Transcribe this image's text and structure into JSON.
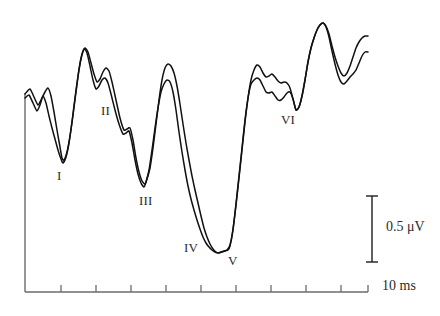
{
  "figure": {
    "kind": "abr-waveform",
    "background_color": "#ffffff",
    "trace_color": "#111111",
    "axis_color": "#6b6b6b",
    "label_color": "#2b2b2b"
  },
  "peak_labels": [
    {
      "text": "I",
      "x": 57,
      "y": 168
    },
    {
      "text": "II",
      "x": 101,
      "y": 103
    },
    {
      "text": "III",
      "x": 139,
      "y": 193
    },
    {
      "text": "IV",
      "x": 184,
      "y": 240
    },
    {
      "text": "V",
      "x": 228,
      "y": 253
    },
    {
      "text": "VI",
      "x": 281,
      "y": 112
    }
  ],
  "scale_bars": {
    "vertical": {
      "label": "0.5 μV",
      "label_x": 386,
      "label_y": 219,
      "x": 372,
      "y_top": 196,
      "y_bottom": 262,
      "cap_half_width": 6
    },
    "horizontal": {
      "label": "10 ms",
      "label_x": 382,
      "label_y": 278
    }
  },
  "axes": {
    "x_axis": {
      "x_start": 25,
      "x_end": 368,
      "y": 292
    },
    "y_axis": {
      "x": 25,
      "y_top": 93,
      "y_bottom": 292
    },
    "tick_count": 9,
    "tick_length": 7,
    "tick_x_positions": [
      61,
      96,
      131,
      166,
      201,
      236,
      271,
      306,
      341
    ]
  },
  "chart_data": {
    "type": "line",
    "title": "",
    "xlabel": "",
    "ylabel": "",
    "xlim": [
      0,
      10
    ],
    "ylim": [
      -1.0,
      1.0
    ],
    "grid": false,
    "legend": "none",
    "x_unit": "ms",
    "y_unit": "μV",
    "annotations": [
      "I",
      "II",
      "III",
      "IV",
      "V",
      "VI"
    ],
    "series": [
      {
        "name": "trace-a",
        "points": [
          [
            25,
            94
          ],
          [
            30,
            89
          ],
          [
            34,
            97
          ],
          [
            38,
            105
          ],
          [
            41,
            100
          ],
          [
            45,
            92
          ],
          [
            48,
            88
          ],
          [
            51,
            96
          ],
          [
            54,
            112
          ],
          [
            57,
            130
          ],
          [
            60,
            147
          ],
          [
            62,
            158
          ],
          [
            64,
            160
          ],
          [
            67,
            152
          ],
          [
            70,
            136
          ],
          [
            73,
            115
          ],
          [
            76,
            92
          ],
          [
            79,
            70
          ],
          [
            82,
            55
          ],
          [
            85,
            48
          ],
          [
            88,
            52
          ],
          [
            91,
            63
          ],
          [
            94,
            74
          ],
          [
            97,
            82
          ],
          [
            100,
            79
          ],
          [
            103,
            72
          ],
          [
            106,
            68
          ],
          [
            109,
            71
          ],
          [
            112,
            82
          ],
          [
            116,
            100
          ],
          [
            120,
            118
          ],
          [
            124,
            130
          ],
          [
            127,
            129
          ],
          [
            130,
            128
          ],
          [
            133,
            140
          ],
          [
            136,
            158
          ],
          [
            139,
            172
          ],
          [
            142,
            181
          ],
          [
            145,
            184
          ],
          [
            147,
            179
          ],
          [
            150,
            168
          ],
          [
            153,
            148
          ],
          [
            156,
            124
          ],
          [
            159,
            100
          ],
          [
            162,
            80
          ],
          [
            165,
            68
          ],
          [
            168,
            64
          ],
          [
            171,
            66
          ],
          [
            174,
            73
          ],
          [
            177,
            86
          ],
          [
            180,
            104
          ],
          [
            183,
            124
          ],
          [
            186,
            143
          ],
          [
            189,
            160
          ],
          [
            192,
            176
          ],
          [
            195,
            190
          ],
          [
            198,
            203
          ],
          [
            201,
            216
          ],
          [
            204,
            228
          ],
          [
            207,
            237
          ],
          [
            210,
            244
          ],
          [
            213,
            249
          ],
          [
            216,
            252
          ],
          [
            219,
            253
          ],
          [
            222,
            252
          ],
          [
            225,
            251
          ],
          [
            228,
            250
          ],
          [
            230,
            246
          ],
          [
            233,
            230
          ],
          [
            236,
            205
          ],
          [
            239,
            178
          ],
          [
            242,
            150
          ],
          [
            245,
            122
          ],
          [
            248,
            98
          ],
          [
            251,
            80
          ],
          [
            254,
            70
          ],
          [
            257,
            65
          ],
          [
            260,
            67
          ],
          [
            263,
            73
          ],
          [
            266,
            77
          ],
          [
            269,
            76
          ],
          [
            272,
            74
          ],
          [
            275,
            77
          ],
          [
            278,
            81
          ],
          [
            281,
            83
          ],
          [
            284,
            82
          ],
          [
            287,
            83
          ],
          [
            290,
            88
          ],
          [
            293,
            99
          ],
          [
            296,
            110
          ],
          [
            299,
            107
          ],
          [
            302,
            96
          ],
          [
            305,
            80
          ],
          [
            308,
            62
          ],
          [
            311,
            48
          ],
          [
            314,
            38
          ],
          [
            317,
            30
          ],
          [
            320,
            25
          ],
          [
            323,
            23
          ],
          [
            326,
            26
          ],
          [
            329,
            34
          ],
          [
            332,
            46
          ],
          [
            335,
            57
          ],
          [
            338,
            66
          ],
          [
            341,
            73
          ],
          [
            344,
            76
          ],
          [
            347,
            73
          ],
          [
            350,
            66
          ],
          [
            353,
            57
          ],
          [
            356,
            48
          ],
          [
            359,
            42
          ],
          [
            362,
            38
          ],
          [
            365,
            36
          ],
          [
            368,
            36
          ]
        ]
      },
      {
        "name": "trace-b",
        "points": [
          [
            25,
            98
          ],
          [
            29,
            95
          ],
          [
            33,
            103
          ],
          [
            37,
            111
          ],
          [
            40,
            105
          ],
          [
            43,
            96
          ],
          [
            46,
            103
          ],
          [
            49,
            116
          ],
          [
            52,
            128
          ],
          [
            55,
            139
          ],
          [
            58,
            150
          ],
          [
            61,
            159
          ],
          [
            63,
            163
          ],
          [
            66,
            157
          ],
          [
            69,
            143
          ],
          [
            72,
            122
          ],
          [
            75,
            98
          ],
          [
            78,
            76
          ],
          [
            81,
            58
          ],
          [
            84,
            49
          ],
          [
            87,
            53
          ],
          [
            90,
            66
          ],
          [
            93,
            80
          ],
          [
            96,
            89
          ],
          [
            99,
            86
          ],
          [
            102,
            80
          ],
          [
            105,
            78
          ],
          [
            108,
            83
          ],
          [
            111,
            94
          ],
          [
            115,
            110
          ],
          [
            119,
            124
          ],
          [
            123,
            134
          ],
          [
            126,
            133
          ],
          [
            129,
            131
          ],
          [
            132,
            143
          ],
          [
            135,
            160
          ],
          [
            138,
            174
          ],
          [
            141,
            183
          ],
          [
            144,
            187
          ],
          [
            146,
            182
          ],
          [
            149,
            170
          ],
          [
            152,
            150
          ],
          [
            155,
            128
          ],
          [
            158,
            108
          ],
          [
            161,
            92
          ],
          [
            164,
            84
          ],
          [
            167,
            80
          ],
          [
            170,
            82
          ],
          [
            173,
            92
          ],
          [
            176,
            110
          ],
          [
            179,
            132
          ],
          [
            182,
            152
          ],
          [
            185,
            170
          ],
          [
            188,
            186
          ],
          [
            191,
            199
          ],
          [
            194,
            210
          ],
          [
            197,
            220
          ],
          [
            200,
            229
          ],
          [
            203,
            237
          ],
          [
            206,
            243
          ],
          [
            209,
            247
          ],
          [
            212,
            250
          ],
          [
            215,
            252
          ],
          [
            218,
            253
          ],
          [
            221,
            252
          ],
          [
            224,
            251
          ],
          [
            227,
            250
          ],
          [
            230,
            245
          ],
          [
            233,
            229
          ],
          [
            236,
            204
          ],
          [
            239,
            176
          ],
          [
            242,
            148
          ],
          [
            245,
            120
          ],
          [
            248,
            98
          ],
          [
            251,
            84
          ],
          [
            254,
            80
          ],
          [
            257,
            78
          ],
          [
            260,
            80
          ],
          [
            263,
            86
          ],
          [
            266,
            92
          ],
          [
            269,
            93
          ],
          [
            272,
            92
          ],
          [
            275,
            96
          ],
          [
            278,
            100
          ],
          [
            281,
            100
          ],
          [
            284,
            97
          ],
          [
            287,
            93
          ],
          [
            290,
            92
          ],
          [
            293,
            99
          ],
          [
            296,
            110
          ],
          [
            299,
            107
          ],
          [
            302,
            96
          ],
          [
            305,
            80
          ],
          [
            308,
            62
          ],
          [
            311,
            48
          ],
          [
            314,
            38
          ],
          [
            317,
            30
          ],
          [
            320,
            25
          ],
          [
            323,
            23
          ],
          [
            326,
            27
          ],
          [
            329,
            37
          ],
          [
            332,
            51
          ],
          [
            335,
            64
          ],
          [
            338,
            75
          ],
          [
            341,
            82
          ],
          [
            344,
            84
          ],
          [
            347,
            81
          ],
          [
            350,
            77
          ],
          [
            353,
            74
          ],
          [
            356,
            70
          ],
          [
            359,
            63
          ],
          [
            362,
            56
          ],
          [
            365,
            52
          ],
          [
            368,
            52
          ]
        ]
      }
    ]
  }
}
